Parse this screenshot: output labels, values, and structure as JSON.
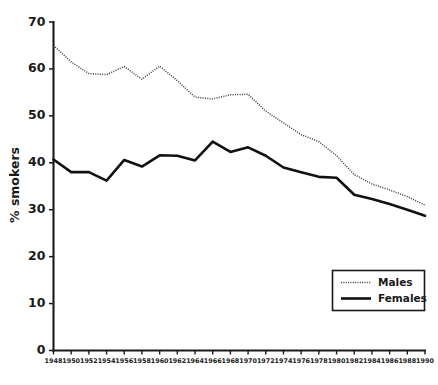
{
  "chart_data": {
    "type": "line",
    "title": "",
    "subtitle": "",
    "xlabel": "",
    "ylabel": "% smokers",
    "xlim": [
      1948,
      1990
    ],
    "ylim": [
      0,
      70
    ],
    "grid": false,
    "legend_position": "bottom-right",
    "x": [
      1948,
      1950,
      1952,
      1954,
      1956,
      1958,
      1960,
      1962,
      1964,
      1966,
      1968,
      1970,
      1972,
      1974,
      1976,
      1978,
      1980,
      1982,
      1984,
      1986,
      1988,
      1990
    ],
    "xtick_labels": [
      "1948",
      "1950",
      "1952",
      "1954",
      "1956",
      "1958",
      "1960",
      "1962",
      "1964",
      "1966",
      "1968",
      "1970",
      "1972",
      "1974",
      "1976",
      "1978",
      "1980",
      "1982",
      "1984",
      "1986",
      "1988",
      "1990"
    ],
    "ytick_values": [
      0,
      10,
      20,
      30,
      40,
      50,
      60,
      70
    ],
    "ytick_labels": [
      "0",
      "10",
      "20",
      "30",
      "40",
      "50",
      "60",
      "70"
    ],
    "series": [
      {
        "name": "Males",
        "style": "dotted",
        "color": "#3a3a3a",
        "values": [
          65.0,
          61.5,
          59.0,
          58.8,
          60.5,
          57.8,
          60.6,
          57.5,
          54.0,
          53.6,
          54.5,
          54.6,
          51.0,
          48.5,
          46.0,
          44.5,
          41.5,
          37.5,
          35.5,
          34.2,
          32.8,
          31.0
        ]
      },
      {
        "name": "Females",
        "style": "solid",
        "color": "#111111",
        "values": [
          40.7,
          38.0,
          38.0,
          36.2,
          40.6,
          39.2,
          41.6,
          41.5,
          40.5,
          44.5,
          42.3,
          43.3,
          41.5,
          39.0,
          38.0,
          37.0,
          36.8,
          33.2,
          32.3,
          31.2,
          30.0,
          28.7
        ]
      }
    ]
  },
  "legend": {
    "entries": [
      {
        "label": "Males"
      },
      {
        "label": "Females"
      }
    ]
  },
  "axes": {
    "y_axis_title": "% smokers"
  }
}
